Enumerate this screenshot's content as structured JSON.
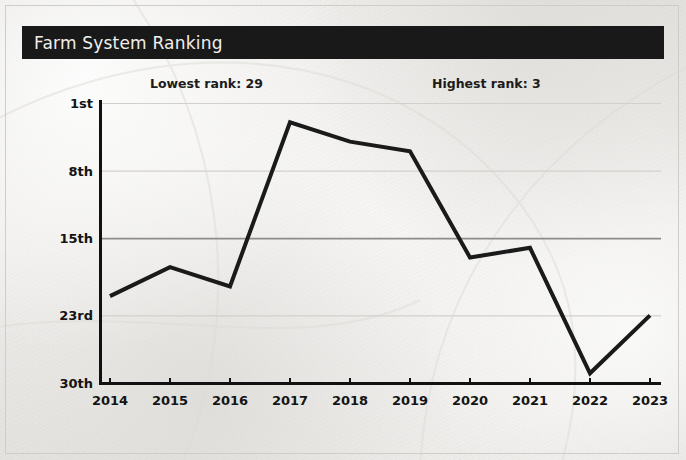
{
  "header": {
    "title": "Farm System Ranking"
  },
  "annotations": {
    "lowest": "Lowest rank: 29",
    "highest": "Highest rank: 3"
  },
  "colors": {
    "title_bar_bg": "#191919",
    "title_text": "#f0efed",
    "line": "#1a1a1a",
    "axis": "#111111",
    "gridline_light": "#d2d0cc",
    "gridline_emphasis": "#8e8c88",
    "page_bg": "#f3f2f0"
  },
  "chart_data": {
    "type": "line",
    "title": "Farm System Ranking",
    "xlabel": "",
    "ylabel": "",
    "x": [
      2014,
      2015,
      2016,
      2017,
      2018,
      2019,
      2020,
      2021,
      2022,
      2023
    ],
    "categories": [
      "2014",
      "2015",
      "2016",
      "2017",
      "2018",
      "2019",
      "2020",
      "2021",
      "2022",
      "2023"
    ],
    "values": [
      21,
      18,
      20,
      3,
      5,
      6,
      17,
      16,
      29,
      23
    ],
    "series": [
      {
        "name": "Farm system ranking",
        "values": [
          21,
          18,
          20,
          3,
          5,
          6,
          17,
          16,
          29,
          23
        ]
      }
    ],
    "y_inverted": true,
    "ylim": [
      1,
      30
    ],
    "ytick_values": [
      1,
      8,
      15,
      23,
      30
    ],
    "ytick_labels": [
      "1st",
      "8th",
      "15th",
      "23rd",
      "30th"
    ],
    "xtick_labels": [
      "2014",
      "2015",
      "2016",
      "2017",
      "2018",
      "2019",
      "2020",
      "2021",
      "2022",
      "2023"
    ],
    "grid": true,
    "legend": "none",
    "annotations": [
      "Lowest rank: 29",
      "Highest rank: 3"
    ],
    "highest_rank": 3,
    "lowest_rank": 29
  }
}
